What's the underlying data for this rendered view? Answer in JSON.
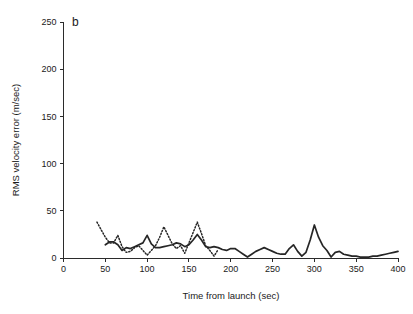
{
  "figure": {
    "panel_label": "b"
  },
  "chart_data": {
    "type": "line",
    "title": "",
    "subtitle": "",
    "panel": "b",
    "xlabel": "Time from launch (sec)",
    "ylabel": "RMS velocity error (m/sec)",
    "xlim": [
      0,
      400
    ],
    "ylim": [
      0,
      250
    ],
    "xticks": [
      0,
      50,
      100,
      150,
      200,
      250,
      300,
      350,
      400
    ],
    "yticks": [
      0,
      50,
      100,
      150,
      200,
      250
    ],
    "xticklabels": [
      "0",
      "50",
      "100",
      "150",
      "200",
      "250",
      "300",
      "350",
      "400"
    ],
    "yticklabels": [
      "0",
      "50",
      "100",
      "150",
      "200",
      "250"
    ],
    "grid": false,
    "legend": "none",
    "legend_entries": [],
    "annotations": [],
    "series": [
      {
        "name": "solid-line",
        "style": "solid",
        "color": "#262626",
        "x": [
          50,
          55,
          60,
          65,
          70,
          75,
          80,
          85,
          90,
          95,
          100,
          105,
          110,
          115,
          120,
          125,
          130,
          135,
          140,
          145,
          150,
          155,
          160,
          165,
          170,
          175,
          180,
          185,
          190,
          195,
          200,
          205,
          210,
          215,
          220,
          225,
          230,
          235,
          240,
          245,
          250,
          255,
          260,
          265,
          270,
          275,
          280,
          285,
          290,
          295,
          300,
          305,
          310,
          315,
          320,
          325,
          330,
          335,
          340,
          345,
          350,
          355,
          360,
          365,
          370,
          375,
          380,
          385,
          390,
          395,
          400
        ],
        "y": [
          14,
          17,
          17,
          14,
          8,
          11,
          10,
          12,
          14,
          16,
          24,
          15,
          11,
          11,
          12,
          13,
          14,
          16,
          15,
          12,
          14,
          19,
          25,
          19,
          12,
          11,
          12,
          11,
          9,
          8,
          10,
          10,
          7,
          4,
          1,
          4,
          7,
          9,
          11,
          9,
          7,
          5,
          4,
          4,
          10,
          14,
          7,
          2,
          6,
          19,
          35,
          22,
          13,
          8,
          1,
          6,
          7,
          4,
          3,
          2,
          2,
          1,
          1,
          1,
          2,
          2,
          3,
          4,
          5,
          6,
          7
        ]
      },
      {
        "name": "dotted-line",
        "style": "dotted",
        "color": "#262626",
        "x": [
          40,
          45,
          50,
          55,
          60,
          65,
          70,
          75,
          80,
          85,
          90,
          95,
          100,
          105,
          110,
          115,
          120,
          125,
          130,
          135,
          140,
          145,
          150,
          155,
          160,
          165,
          170,
          175,
          180,
          185
        ],
        "y": [
          38,
          30,
          22,
          16,
          16,
          24,
          12,
          6,
          7,
          11,
          13,
          8,
          3,
          8,
          13,
          22,
          33,
          24,
          15,
          10,
          13,
          5,
          16,
          27,
          38,
          26,
          13,
          8,
          2,
          9
        ]
      }
    ]
  }
}
